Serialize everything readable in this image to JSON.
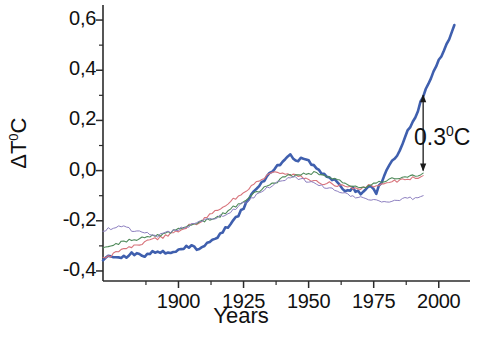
{
  "chart_data": {
    "type": "line",
    "title": "",
    "xlabel": "Years",
    "ylabel": "ΔT°C",
    "ylabel_base": "ΔT",
    "ylabel_sup": "0",
    "ylabel_tail": "C",
    "xlim": [
      1871,
      2012
    ],
    "ylim": [
      -0.44,
      0.66
    ],
    "grid": false,
    "legend": "none",
    "x_ticks": [
      1900,
      1925,
      1950,
      1975,
      2000
    ],
    "x_tick_labels": [
      "1900",
      "1925",
      "1950",
      "1975",
      "2000"
    ],
    "x_minor_ticks": [
      1887.5,
      1912.5,
      1937.5,
      1962.5,
      1987.5,
      2012.5
    ],
    "y_ticks": [
      0.6,
      0.4,
      0.2,
      0.0,
      -0.2,
      -0.4
    ],
    "y_tick_labels": [
      "0,6",
      "0,4",
      "0,2",
      "0,0",
      "-0,2",
      "-0,4"
    ],
    "y_minor_ticks": [
      0.5,
      0.3,
      0.1,
      -0.1,
      -0.3
    ],
    "annotations": [
      {
        "name": "delta-0.3-arrow",
        "text": "0.3°C",
        "text_base": "0.3",
        "text_sup": "0",
        "text_tail": "C",
        "value": 0.3,
        "x_year": 1994,
        "y_from": 0.0,
        "y_to": 0.3,
        "style": "double-headed-arrow"
      }
    ],
    "colors": {
      "blue": "#3f5fae",
      "red": "#d8747c",
      "green": "#4f8a5a",
      "purple": "#8d7fc0",
      "axis": "#2b2b2b",
      "background": "#ffffff"
    },
    "series": [
      {
        "name": "blue",
        "label": "Series blue (thick)",
        "color": "#3f5fae",
        "width": 2.6,
        "x": [
          1871,
          1874,
          1877,
          1880,
          1883,
          1886,
          1889,
          1892,
          1895,
          1898,
          1901,
          1904,
          1907,
          1910,
          1913,
          1916,
          1919,
          1922,
          1925,
          1928,
          1931,
          1934,
          1937,
          1940,
          1943,
          1946,
          1949,
          1952,
          1955,
          1958,
          1961,
          1964,
          1967,
          1970,
          1973,
          1976,
          1979,
          1982,
          1985,
          1988,
          1991,
          1994,
          1997,
          2000,
          2003,
          2006
        ],
        "values": [
          -0.35,
          -0.34,
          -0.35,
          -0.34,
          -0.33,
          -0.34,
          -0.33,
          -0.32,
          -0.33,
          -0.32,
          -0.31,
          -0.3,
          -0.31,
          -0.3,
          -0.28,
          -0.25,
          -0.22,
          -0.19,
          -0.15,
          -0.1,
          -0.06,
          -0.02,
          0.01,
          0.03,
          0.06,
          0.04,
          0.05,
          0.02,
          -0.01,
          -0.03,
          -0.04,
          -0.08,
          -0.07,
          -0.09,
          -0.06,
          -0.09,
          -0.02,
          0.04,
          0.08,
          0.16,
          0.21,
          0.3,
          0.37,
          0.44,
          0.5,
          0.58
        ]
      },
      {
        "name": "red",
        "label": "Series red",
        "color": "#d8747c",
        "width": 1.1,
        "x": [
          1871,
          1874,
          1877,
          1880,
          1883,
          1886,
          1889,
          1892,
          1895,
          1898,
          1901,
          1904,
          1907,
          1910,
          1913,
          1916,
          1919,
          1922,
          1925,
          1928,
          1931,
          1934,
          1937,
          1940,
          1943,
          1946,
          1949,
          1952,
          1955,
          1958,
          1961,
          1964,
          1967,
          1970,
          1973,
          1976,
          1979,
          1982,
          1985,
          1988,
          1991,
          1994
        ],
        "values": [
          -0.35,
          -0.34,
          -0.32,
          -0.31,
          -0.3,
          -0.29,
          -0.28,
          -0.27,
          -0.26,
          -0.25,
          -0.24,
          -0.22,
          -0.21,
          -0.19,
          -0.17,
          -0.15,
          -0.13,
          -0.11,
          -0.09,
          -0.06,
          -0.04,
          -0.02,
          -0.01,
          -0.01,
          -0.02,
          -0.02,
          -0.03,
          -0.04,
          -0.05,
          -0.05,
          -0.06,
          -0.06,
          -0.07,
          -0.07,
          -0.06,
          -0.06,
          -0.05,
          -0.04,
          -0.04,
          -0.03,
          -0.03,
          -0.02
        ]
      },
      {
        "name": "green",
        "label": "Series green",
        "color": "#4f8a5a",
        "width": 1.1,
        "x": [
          1871,
          1874,
          1877,
          1880,
          1883,
          1886,
          1889,
          1892,
          1895,
          1898,
          1901,
          1904,
          1907,
          1910,
          1913,
          1916,
          1919,
          1922,
          1925,
          1928,
          1931,
          1934,
          1937,
          1940,
          1943,
          1946,
          1949,
          1952,
          1955,
          1958,
          1961,
          1964,
          1967,
          1970,
          1973,
          1976,
          1979,
          1982,
          1985,
          1988,
          1991,
          1994
        ],
        "values": [
          -0.31,
          -0.3,
          -0.29,
          -0.28,
          -0.28,
          -0.27,
          -0.26,
          -0.26,
          -0.25,
          -0.24,
          -0.23,
          -0.22,
          -0.21,
          -0.2,
          -0.19,
          -0.18,
          -0.16,
          -0.14,
          -0.12,
          -0.1,
          -0.08,
          -0.06,
          -0.05,
          -0.03,
          -0.02,
          -0.02,
          -0.01,
          -0.01,
          -0.02,
          -0.03,
          -0.04,
          -0.05,
          -0.06,
          -0.07,
          -0.06,
          -0.05,
          -0.04,
          -0.03,
          -0.03,
          -0.02,
          -0.02,
          -0.01
        ]
      },
      {
        "name": "purple",
        "label": "Series purple (thin)",
        "color": "#8d7fc0",
        "width": 1.0,
        "x": [
          1871,
          1874,
          1877,
          1880,
          1883,
          1886,
          1889,
          1892,
          1895,
          1898,
          1901,
          1904,
          1907,
          1910,
          1913,
          1916,
          1919,
          1922,
          1925,
          1928,
          1931,
          1934,
          1937,
          1940,
          1943,
          1946,
          1949,
          1952,
          1955,
          1958,
          1961,
          1964,
          1967,
          1970,
          1973,
          1976,
          1979,
          1982,
          1985,
          1988,
          1991,
          1994
        ],
        "values": [
          -0.24,
          -0.23,
          -0.22,
          -0.23,
          -0.24,
          -0.24,
          -0.25,
          -0.26,
          -0.25,
          -0.24,
          -0.23,
          -0.22,
          -0.21,
          -0.2,
          -0.19,
          -0.18,
          -0.17,
          -0.15,
          -0.13,
          -0.11,
          -0.09,
          -0.07,
          -0.05,
          -0.04,
          -0.03,
          -0.03,
          -0.04,
          -0.05,
          -0.06,
          -0.07,
          -0.08,
          -0.09,
          -0.1,
          -0.11,
          -0.11,
          -0.12,
          -0.12,
          -0.12,
          -0.12,
          -0.11,
          -0.11,
          -0.1
        ]
      }
    ]
  }
}
